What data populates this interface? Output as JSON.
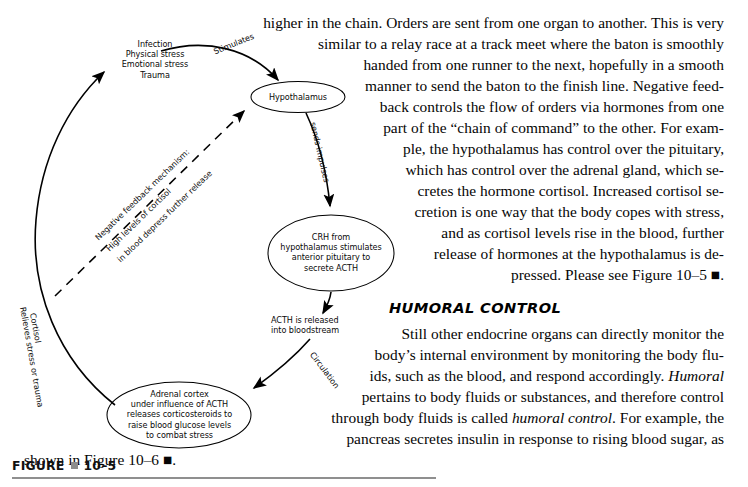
{
  "figure": {
    "caption_label": "FIGURE",
    "caption_number": "10–5",
    "nodes": {
      "stimuli": "Infection\nPhysical stress\nEmotional stress\nTrauma",
      "hypothalamus": "Hypothalamus",
      "crh": "CRH from\nhypothalamus stimulates\nanterior pituitary to\nsecrete ACTH",
      "acth_released": "ACTH is released\ninto bloodstream",
      "adrenal_cortex": "Adrenal cortex\nunder influence of ACTH\nreleases corticosteroids to\nraise blood glucose levels\nto combat stress"
    },
    "arrow_labels": {
      "stimulates": "Stimulates",
      "sends_impulses": "sends impulses",
      "circulation": "Circulation",
      "cortisol": "Cortisol",
      "relieves": "Relieves stress or trauma",
      "feedback_line1": "Negative feedback mechanism:",
      "feedback_line2": "High levels of cortisol",
      "feedback_line3": "in blood depress further release"
    }
  },
  "article": {
    "heading": "HUMORAL CONTROL",
    "paragraph1_lines": [
      "higher in the chain. Orders are sent from one organ to another. This is very",
      "similar to a relay race at a track meet where the baton is smoothly",
      "handed from one runner to the next, hopefully in a smooth",
      "manner to send the baton to the finish line. Negative feed-",
      "back controls the flow of orders via hormones from one",
      "part of the “chain of command” to the other. For exam-",
      "ple, the hypothalamus has control over the pituitary,",
      "which has control over the adrenal gland, which se-",
      "cretes the hormone cortisol. Increased cortisol se-",
      "cretion is one way that the body copes with stress,",
      "and as cortisol levels rise in the blood, further",
      "release of hormones at the hypothalamus is de-",
      "pressed. Please see Figure 10–5 ■."
    ],
    "paragraph2_lines": [
      "Still other endocrine organs can directly monitor the",
      "body’s internal environment by monitoring the body flu-",
      "ids, such as the blood, and respond accordingly. Humoral",
      "pertains to body fluids or substances, and therefore control",
      "through body fluids is called humoral control. For example, the",
      "pancreas secretes insulin in response to rising blood sugar, as",
      "shown in Figure 10–6 ■."
    ]
  },
  "colors": {
    "ink": "#000000",
    "caption_rule": "#8f8f8f",
    "caption_square": "#8d8d8d"
  }
}
